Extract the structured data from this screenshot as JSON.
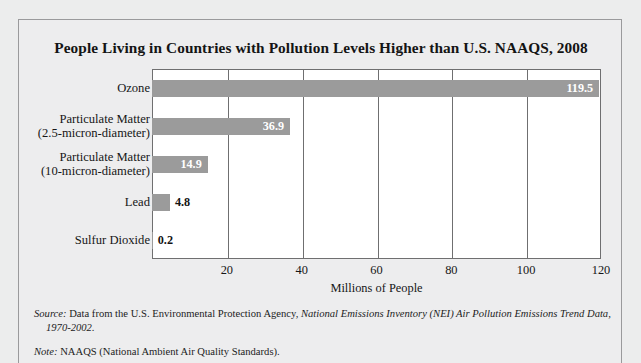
{
  "figure": {
    "title": "People Living in Countries with Pollution Levels Higher than U.S. NAAQS, 2008",
    "source_label": "Source:",
    "source_text": " Data from the U.S. Environmental Protection Agency, ",
    "source_italic": "National Emissions Inventory (NEI) Air Pollution Emissions Trend Data,",
    "source_italic_line2": "1970-2002.",
    "note_label": "Note:",
    "note_text": " NAAQS (National Ambient Air Quality Standards)."
  },
  "chart_data": {
    "type": "bar",
    "orientation": "horizontal",
    "title": "People Living in Countries with Pollution Levels Higher than U.S. NAAQS, 2008",
    "xlabel": "Millions of People",
    "ylabel": "",
    "xlim": [
      0,
      120
    ],
    "xticks": [
      20,
      40,
      60,
      80,
      100,
      120
    ],
    "grid": "vertical",
    "legend": "none",
    "bar_color": "#9b9b9b",
    "categories": [
      "Ozone",
      "Particulate Matter (2.5-micron-diameter)",
      "Particulate Matter (10-micron-diameter)",
      "Lead",
      "Sulfur Dioxide"
    ],
    "category_lines": [
      [
        "Ozone"
      ],
      [
        "Particulate Matter",
        "(2.5-micron-diameter)"
      ],
      [
        "Particulate Matter",
        "(10-micron-diameter)"
      ],
      [
        "Lead"
      ],
      [
        "Sulfur Dioxide"
      ]
    ],
    "values": [
      119.5,
      36.9,
      14.9,
      4.8,
      0.2
    ],
    "value_labels": [
      "119.5",
      "36.9",
      "14.9",
      "4.8",
      "0.2"
    ],
    "label_placement": [
      "inside",
      "inside",
      "inside",
      "outside",
      "outside"
    ]
  }
}
